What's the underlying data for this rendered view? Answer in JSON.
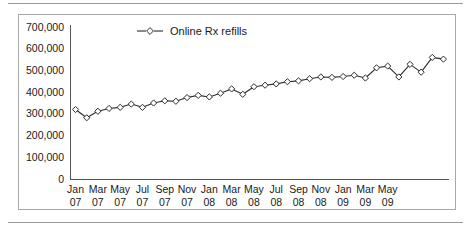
{
  "figure": {
    "legend_label": "Online Rx refills",
    "marker_shape": "diamond",
    "line_color": "#2b2b2b",
    "marker_fill": "#ffffff",
    "axis_color": "#555555",
    "frame_color": "#a8a8a8",
    "background": "#ffffff"
  },
  "chart_data": {
    "type": "line",
    "title": "",
    "subtitle": "",
    "xlabel": "",
    "ylabel": "",
    "ylim": [
      0,
      700000
    ],
    "ytick_step": 100000,
    "grid": false,
    "legend_position": "top-center",
    "series": [
      {
        "name": "Online Rx refills",
        "values": [
          320000,
          282000,
          312000,
          325000,
          330000,
          345000,
          330000,
          350000,
          360000,
          358000,
          375000,
          385000,
          378000,
          395000,
          415000,
          390000,
          425000,
          432000,
          438000,
          448000,
          452000,
          462000,
          470000,
          468000,
          472000,
          478000,
          465000,
          512000,
          520000,
          470000,
          528000,
          492000,
          560000,
          552000
        ]
      }
    ],
    "yticks": [
      "700,000",
      "600,000",
      "500,000",
      "400,000",
      "300,000",
      "200,000",
      "100,000",
      "0"
    ],
    "xticks": [
      {
        "month": "Jan",
        "year": "07"
      },
      {
        "month": "Mar",
        "year": "07"
      },
      {
        "month": "May",
        "year": "07"
      },
      {
        "month": "Jul",
        "year": "07"
      },
      {
        "month": "Sep",
        "year": "07"
      },
      {
        "month": "Nov",
        "year": "07"
      },
      {
        "month": "Jan",
        "year": "08"
      },
      {
        "month": "Mar",
        "year": "08"
      },
      {
        "month": "May",
        "year": "08"
      },
      {
        "month": "Jul",
        "year": "08"
      },
      {
        "month": "Sep",
        "year": "08"
      },
      {
        "month": "Nov",
        "year": "08"
      },
      {
        "month": "Jan",
        "year": "09"
      },
      {
        "month": "Mar",
        "year": "09"
      },
      {
        "month": "May",
        "year": "09"
      }
    ]
  }
}
